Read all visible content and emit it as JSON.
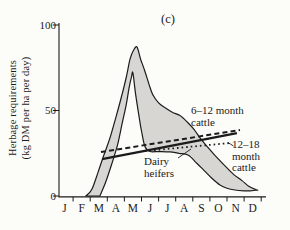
{
  "figure": {
    "panel_label": "(c)",
    "y_axis": {
      "label": "Herbage requirements\n(kg DM per ha per day)",
      "tick_values": [
        0,
        50,
        100
      ],
      "tick_labels": [
        "0",
        "50",
        "100"
      ]
    },
    "x_axis": {
      "months": [
        "J",
        "F",
        "M",
        "A",
        "M",
        "J",
        "J",
        "A",
        "S",
        "O",
        "N",
        "D"
      ]
    },
    "annotations": {
      "cattle_6_12": "6–12 month\ncattle",
      "cattle_12_18": "12–18\nmonth\ncattle",
      "dairy_heifers": "Dairy\nheifers"
    },
    "colors": {
      "ink": "#1b1b1b",
      "band_fill": "#d7d6d2",
      "background": "#fcfcf9"
    }
  },
  "chart_data": {
    "type": "area",
    "title": "(c)",
    "ylabel": "Herbage requirements (kg DM per ha per day)",
    "ylim": [
      0,
      100
    ],
    "x_categories": [
      "J",
      "F",
      "M",
      "A",
      "M",
      "J",
      "J",
      "A",
      "S",
      "O",
      "N",
      "D"
    ],
    "x_unit": "month position, 0–12",
    "series": [
      {
        "name": "herbage supply envelope – upper boundary",
        "style": "curve",
        "points": [
          [
            1.75,
            0
          ],
          [
            2.1,
            4
          ],
          [
            2.46,
            14
          ],
          [
            2.8,
            24
          ],
          [
            3.16,
            34
          ],
          [
            3.5,
            46
          ],
          [
            3.8,
            57
          ],
          [
            4.1,
            69
          ],
          [
            4.33,
            80
          ],
          [
            4.55,
            85.5
          ],
          [
            4.74,
            87
          ],
          [
            4.95,
            80
          ],
          [
            5.2,
            73
          ],
          [
            5.45,
            65
          ],
          [
            5.67,
            59
          ],
          [
            6.0,
            54.5
          ],
          [
            6.32,
            52
          ],
          [
            6.8,
            49
          ],
          [
            7.25,
            47
          ],
          [
            7.7,
            43
          ],
          [
            8.07,
            39
          ],
          [
            8.5,
            33
          ],
          [
            9.01,
            27
          ],
          [
            9.5,
            21.5
          ],
          [
            9.94,
            17
          ],
          [
            10.4,
            12.5
          ],
          [
            10.88,
            9
          ],
          [
            11.3,
            5.5
          ],
          [
            11.75,
            3.5
          ]
        ]
      },
      {
        "name": "herbage supply envelope – lower boundary",
        "style": "curve",
        "points": [
          [
            2.57,
            0
          ],
          [
            2.9,
            8
          ],
          [
            3.27,
            19
          ],
          [
            3.6,
            30
          ],
          [
            3.86,
            42
          ],
          [
            4.1,
            53
          ],
          [
            4.27,
            63
          ],
          [
            4.42,
            70
          ],
          [
            4.5,
            72
          ],
          [
            4.65,
            60
          ],
          [
            4.85,
            47
          ],
          [
            5.0,
            38
          ],
          [
            5.2,
            29
          ],
          [
            5.5,
            26
          ],
          [
            6.0,
            26
          ],
          [
            6.67,
            25.8
          ],
          [
            7.2,
            25
          ],
          [
            7.72,
            24
          ],
          [
            8.2,
            19.5
          ],
          [
            8.65,
            15
          ],
          [
            9.1,
            10.5
          ],
          [
            9.59,
            6.4
          ],
          [
            10.0,
            4.5
          ],
          [
            10.47,
            3.5
          ],
          [
            11.0,
            3
          ],
          [
            11.35,
            3
          ],
          [
            11.75,
            3.5
          ]
        ]
      },
      {
        "name": "6–12 month cattle",
        "style": "solid-thick",
        "points": [
          [
            2.69,
            21.6
          ],
          [
            10.58,
            36.8
          ]
        ]
      },
      {
        "name": "Dairy heifers",
        "style": "dashed",
        "points": [
          [
            2.63,
            25.7
          ],
          [
            10.76,
            38.6
          ]
        ]
      },
      {
        "name": "12–18 month cattle",
        "style": "dotted",
        "points": [
          [
            5.2,
            26.3
          ],
          [
            10.18,
            31.0
          ]
        ]
      }
    ]
  }
}
